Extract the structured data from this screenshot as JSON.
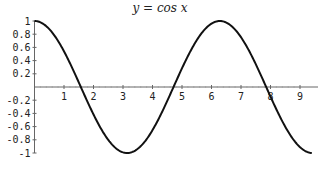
{
  "chart_data": {
    "type": "line",
    "title": "y = cos x",
    "xlabel": "",
    "ylabel": "",
    "xlim": [
      0,
      9.4
    ],
    "ylim": [
      -1,
      1
    ],
    "grid": false,
    "x_ticks": [
      1,
      2,
      3,
      4,
      5,
      6,
      7,
      8,
      9
    ],
    "y_ticks": [
      1,
      0.8,
      0.6,
      0.4,
      0.2,
      -0.2,
      -0.4,
      -0.6,
      -0.8,
      -1
    ],
    "y_tick_labels": [
      "1",
      "0.8",
      "0.6",
      "0.4",
      "0.2",
      "-0.2",
      "-0.4",
      "-0.6",
      "-0.8",
      "-1"
    ],
    "series": [
      {
        "name": "cos x",
        "function": "cos(x)",
        "x": [
          0,
          0.5,
          1,
          1.5708,
          2,
          2.5,
          3,
          3.1416,
          3.5,
          4,
          4.5,
          4.7124,
          5,
          5.5,
          6,
          6.2832,
          6.5,
          7,
          7.5,
          7.854,
          8,
          8.5,
          9,
          9.4
        ],
        "values": [
          1,
          0.878,
          0.54,
          0,
          -0.416,
          -0.801,
          -0.99,
          -1,
          -0.936,
          -0.654,
          -0.211,
          0,
          0.284,
          0.709,
          0.96,
          1,
          0.977,
          0.754,
          0.347,
          0,
          -0.146,
          -0.602,
          -0.911,
          -0.999
        ]
      }
    ]
  }
}
